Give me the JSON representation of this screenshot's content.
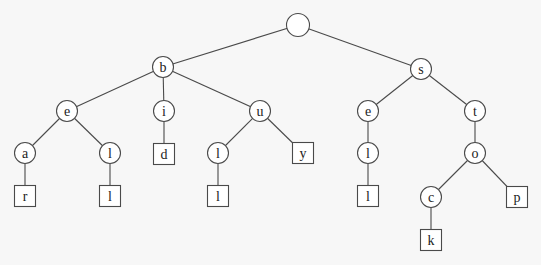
{
  "diagram": {
    "type": "trie",
    "words": [
      "bear",
      "bell",
      "bid",
      "bull",
      "buy",
      "sell",
      "stock",
      "stop"
    ],
    "nodes": [
      {
        "id": "root",
        "label": "",
        "kind": "internal",
        "x": 298,
        "y": 25
      },
      {
        "id": "b",
        "label": "b",
        "kind": "internal",
        "x": 163,
        "y": 67
      },
      {
        "id": "s",
        "label": "s",
        "kind": "internal",
        "x": 421,
        "y": 69
      },
      {
        "id": "be",
        "label": "e",
        "kind": "internal",
        "x": 67,
        "y": 111
      },
      {
        "id": "bi",
        "label": "i",
        "kind": "internal",
        "x": 164,
        "y": 111
      },
      {
        "id": "bu",
        "label": "u",
        "kind": "internal",
        "x": 260,
        "y": 111
      },
      {
        "id": "se",
        "label": "e",
        "kind": "internal",
        "x": 368,
        "y": 111
      },
      {
        "id": "st",
        "label": "t",
        "kind": "internal",
        "x": 475,
        "y": 111
      },
      {
        "id": "bea",
        "label": "a",
        "kind": "internal",
        "x": 25,
        "y": 153
      },
      {
        "id": "bel",
        "label": "l",
        "kind": "internal",
        "x": 110,
        "y": 153
      },
      {
        "id": "bid",
        "label": "d",
        "kind": "leaf",
        "x": 164,
        "y": 154
      },
      {
        "id": "bul",
        "label": "l",
        "kind": "internal",
        "x": 218,
        "y": 153
      },
      {
        "id": "buy",
        "label": "y",
        "kind": "leaf",
        "x": 303,
        "y": 153
      },
      {
        "id": "sel",
        "label": "l",
        "kind": "internal",
        "x": 368,
        "y": 153
      },
      {
        "id": "sto",
        "label": "o",
        "kind": "internal",
        "x": 475,
        "y": 153
      },
      {
        "id": "bear",
        "label": "r",
        "kind": "leaf",
        "x": 25,
        "y": 196
      },
      {
        "id": "bell",
        "label": "l",
        "kind": "leaf",
        "x": 110,
        "y": 196
      },
      {
        "id": "bull",
        "label": "l",
        "kind": "leaf",
        "x": 218,
        "y": 196
      },
      {
        "id": "sell",
        "label": "l",
        "kind": "leaf",
        "x": 368,
        "y": 196
      },
      {
        "id": "stoc",
        "label": "c",
        "kind": "internal",
        "x": 431,
        "y": 197
      },
      {
        "id": "stop",
        "label": "p",
        "kind": "leaf",
        "x": 517,
        "y": 197
      },
      {
        "id": "stock",
        "label": "k",
        "kind": "leaf",
        "x": 431,
        "y": 240
      }
    ],
    "edges": [
      [
        "root",
        "b"
      ],
      [
        "root",
        "s"
      ],
      [
        "b",
        "be"
      ],
      [
        "b",
        "bi"
      ],
      [
        "b",
        "bu"
      ],
      [
        "s",
        "se"
      ],
      [
        "s",
        "st"
      ],
      [
        "be",
        "bea"
      ],
      [
        "be",
        "bel"
      ],
      [
        "bi",
        "bid"
      ],
      [
        "bu",
        "bul"
      ],
      [
        "bu",
        "buy"
      ],
      [
        "se",
        "sel"
      ],
      [
        "st",
        "sto"
      ],
      [
        "bea",
        "bear"
      ],
      [
        "bel",
        "bell"
      ],
      [
        "bul",
        "bull"
      ],
      [
        "sel",
        "sell"
      ],
      [
        "sto",
        "stoc"
      ],
      [
        "sto",
        "stop"
      ],
      [
        "stoc",
        "stock"
      ]
    ],
    "style": {
      "stroke": "#4a4a4a",
      "node_fill": "#ffffff",
      "background": "#f7f7f7",
      "internal_radius": 10.5,
      "leaf_size": 21
    }
  }
}
